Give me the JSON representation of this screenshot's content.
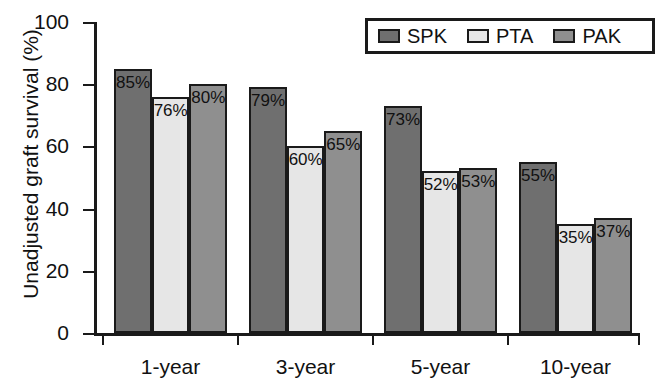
{
  "chart_data": {
    "type": "bar",
    "title": "",
    "subtitle": "",
    "xlabel": "",
    "ylabel": "Unadjusted graft survival (%)",
    "categories": [
      "1-year",
      "3-year",
      "5-year",
      "10-year"
    ],
    "series": [
      {
        "name": "SPK",
        "color": "#6f6f6f",
        "values": [
          85,
          79,
          73,
          55
        ],
        "labels": [
          "85%",
          "79%",
          "73%",
          "55%"
        ]
      },
      {
        "name": "PTA",
        "color": "#e6e6e6",
        "values": [
          76,
          60,
          52,
          35
        ],
        "labels": [
          "76%",
          "60%",
          "52%",
          "35%"
        ]
      },
      {
        "name": "PAK",
        "color": "#8f8f8f",
        "values": [
          80,
          65,
          53,
          37
        ],
        "labels": [
          "80%",
          "65%",
          "53%",
          "37%"
        ]
      }
    ],
    "ylim": [
      0,
      100
    ],
    "yticks": [
      0,
      20,
      40,
      60,
      80,
      100
    ],
    "ytick_labels": [
      "0",
      "20",
      "40",
      "60",
      "80",
      "100"
    ],
    "grid": false,
    "legend_position": "top-right",
    "value_labels_inside_top": true,
    "axis_color": "#1a1a1a",
    "background": "#ffffff"
  },
  "legend": {
    "items": [
      {
        "label": "SPK",
        "color": "#6f6f6f"
      },
      {
        "label": "PTA",
        "color": "#e6e6e6"
      },
      {
        "label": "PAK",
        "color": "#8f8f8f"
      }
    ]
  }
}
